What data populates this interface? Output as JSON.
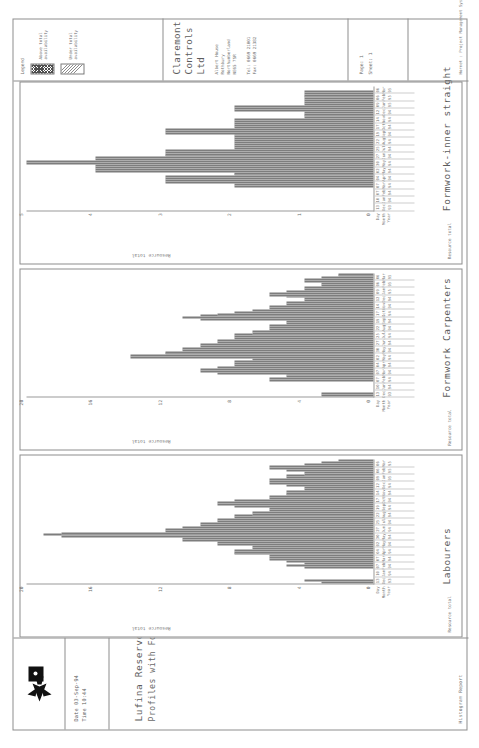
{
  "report": {
    "kind": "Histogram Report",
    "title_line1": "Lufina Reservoir Scheme",
    "title_line2": "Profiles with Formwork Limited",
    "date_label": "Date 03-Sep-94",
    "time_label": "Time 10:44",
    "logo_name": "claremont-bird-logo"
  },
  "company": {
    "name": "Claremont Controls Ltd",
    "address_line1": "Albert House",
    "address_line2": "Rothbury",
    "address_line3": "Northumberland",
    "address_line4": "NE65 7SR",
    "tel": "Tel: 0669 21001",
    "fax": "Fax: 0669 21382"
  },
  "legend": {
    "label": "Legend",
    "items": [
      {
        "name": "above-total-availability",
        "text": "Above total availability",
        "pattern": "cross-hatch"
      },
      {
        "name": "under-total-availability",
        "text": "Under total availability",
        "pattern": "diagonal-hatch"
      }
    ]
  },
  "footer": {
    "page_label": "Page: 1",
    "sheet_label": "Sheet: 1",
    "system": "Hornet : Project Management Systems"
  },
  "axis": {
    "header_day": "Day",
    "header_month": "Month",
    "header_year": "Year",
    "ticks": [
      {
        "d": "13",
        "m": "Dec",
        "y": "93"
      },
      {
        "d": "10",
        "m": "Jan",
        "y": "94"
      },
      {
        "d": "07",
        "m": "Feb",
        "y": "94"
      },
      {
        "d": "07",
        "m": "Mar",
        "y": "94"
      },
      {
        "d": "04",
        "m": "Apr",
        "y": "94"
      },
      {
        "d": "02",
        "m": "May",
        "y": "94"
      },
      {
        "d": "30",
        "m": "May",
        "y": "94"
      },
      {
        "d": "27",
        "m": "Jun",
        "y": "94"
      },
      {
        "d": "25",
        "m": "Jul",
        "y": "94"
      },
      {
        "d": "22",
        "m": "Aug",
        "y": "94"
      },
      {
        "d": "19",
        "m": "Sep",
        "y": "94"
      },
      {
        "d": "17",
        "m": "Oct",
        "y": "94"
      },
      {
        "d": "14",
        "m": "Nov",
        "y": "94"
      },
      {
        "d": "12",
        "m": "Dec",
        "y": "94"
      },
      {
        "d": "09",
        "m": "Jan",
        "y": "95"
      },
      {
        "d": "06",
        "m": "Feb",
        "y": "95"
      },
      {
        "d": "06",
        "m": "Mar",
        "y": "95"
      }
    ]
  },
  "chart_data": [
    {
      "type": "bar",
      "name": "labourers",
      "title": "Labourers",
      "ylabel": "Resource total",
      "xlabel": "",
      "ylim": [
        0,
        20
      ],
      "yticks": [
        0,
        4,
        8,
        12,
        16,
        20
      ],
      "grid": false,
      "categories": [
        "13-Dec-93",
        "20-Dec-93",
        "27-Dec-93",
        "03-Jan-94",
        "10-Jan-94",
        "17-Jan-94",
        "24-Jan-94",
        "31-Jan-94",
        "07-Feb-94",
        "14-Feb-94",
        "21-Feb-94",
        "28-Feb-94",
        "07-Mar-94",
        "14-Mar-94",
        "21-Mar-94",
        "28-Mar-94",
        "04-Apr-94",
        "11-Apr-94",
        "18-Apr-94",
        "25-Apr-94",
        "02-May-94",
        "09-May-94",
        "16-May-94",
        "23-May-94",
        "30-May-94",
        "06-Jun-94",
        "13-Jun-94",
        "20-Jun-94",
        "27-Jun-94",
        "04-Jul-94",
        "11-Jul-94",
        "18-Jul-94",
        "25-Jul-94",
        "01-Aug-94",
        "08-Aug-94",
        "15-Aug-94",
        "22-Aug-94",
        "29-Aug-94",
        "05-Sep-94",
        "12-Sep-94",
        "19-Sep-94",
        "26-Sep-94",
        "03-Oct-94",
        "10-Oct-94",
        "17-Oct-94",
        "24-Oct-94",
        "31-Oct-94",
        "07-Nov-94",
        "14-Nov-94",
        "21-Nov-94",
        "28-Nov-94",
        "05-Dec-94",
        "12-Dec-94",
        "19-Dec-94",
        "26-Dec-94",
        "02-Jan-95",
        "09-Jan-95",
        "16-Jan-95",
        "23-Jan-95",
        "30-Jan-95",
        "06-Feb-95",
        "13-Feb-95",
        "20-Feb-95",
        "27-Feb-95",
        "06-Mar-95"
      ],
      "values": [
        3,
        4,
        0,
        0,
        0,
        0,
        0,
        0,
        4,
        5,
        4,
        5,
        6,
        6,
        6,
        8,
        8,
        8,
        7,
        7,
        9,
        9,
        11,
        11,
        18,
        19,
        18,
        12,
        12,
        11,
        10,
        10,
        9,
        9,
        8,
        8,
        7,
        7,
        6,
        6,
        8,
        9,
        9,
        8,
        6,
        6,
        5,
        5,
        5,
        4,
        4,
        5,
        6,
        6,
        6,
        5,
        5,
        4,
        4,
        5,
        6,
        6,
        4,
        3,
        2
      ],
      "series_flags": "above when value exceeds total availability line"
    },
    {
      "type": "bar",
      "name": "formwork-carpenters",
      "title": "Formwork Carpenters",
      "ylabel": "Resource total",
      "xlabel": "",
      "ylim": [
        0,
        20
      ],
      "yticks": [
        0,
        4,
        8,
        12,
        16,
        20
      ],
      "grid": false,
      "categories": [
        "13-Dec-93",
        "20-Dec-93",
        "27-Dec-93",
        "03-Jan-94",
        "10-Jan-94",
        "17-Jan-94",
        "24-Jan-94",
        "31-Jan-94",
        "07-Feb-94",
        "14-Feb-94",
        "21-Feb-94",
        "28-Feb-94",
        "07-Mar-94",
        "14-Mar-94",
        "21-Mar-94",
        "28-Mar-94",
        "04-Apr-94",
        "11-Apr-94",
        "18-Apr-94",
        "25-Apr-94",
        "02-May-94",
        "09-May-94",
        "16-May-94",
        "23-May-94",
        "30-May-94",
        "06-Jun-94",
        "13-Jun-94",
        "20-Jun-94",
        "27-Jun-94",
        "04-Jul-94",
        "11-Jul-94",
        "18-Jul-94",
        "25-Jul-94",
        "01-Aug-94",
        "08-Aug-94",
        "15-Aug-94",
        "22-Aug-94",
        "29-Aug-94",
        "05-Sep-94",
        "12-Sep-94",
        "19-Sep-94",
        "26-Sep-94",
        "03-Oct-94",
        "10-Oct-94",
        "17-Oct-94",
        "24-Oct-94",
        "31-Oct-94",
        "07-Nov-94",
        "14-Nov-94",
        "21-Nov-94",
        "28-Nov-94",
        "05-Dec-94",
        "12-Dec-94",
        "19-Dec-94",
        "26-Dec-94",
        "02-Jan-95",
        "09-Jan-95",
        "16-Jan-95",
        "23-Jan-95",
        "30-Jan-95",
        "06-Feb-95",
        "13-Feb-95",
        "20-Feb-95",
        "27-Feb-95",
        "06-Mar-95"
      ],
      "values": [
        3,
        3,
        0,
        0,
        0,
        0,
        0,
        0,
        6,
        6,
        5,
        5,
        9,
        10,
        10,
        9,
        8,
        8,
        8,
        7,
        14,
        14,
        12,
        12,
        11,
        11,
        10,
        10,
        9,
        9,
        8,
        8,
        8,
        7,
        7,
        6,
        6,
        6,
        5,
        5,
        10,
        11,
        10,
        9,
        8,
        7,
        6,
        6,
        5,
        5,
        4,
        4,
        5,
        6,
        6,
        5,
        4,
        4,
        3,
        3,
        4,
        4,
        3,
        2,
        2
      ],
      "series_flags": "above when value exceeds total availability line"
    },
    {
      "type": "bar",
      "name": "formwork-inner-straight",
      "title": "Formwork-inner straight",
      "ylabel": "Resource total",
      "xlabel": "",
      "ylim": [
        0,
        5
      ],
      "yticks": [
        0,
        1,
        2,
        3,
        4,
        5
      ],
      "grid": false,
      "categories": [
        "13-Dec-93",
        "20-Dec-93",
        "27-Dec-93",
        "03-Jan-94",
        "10-Jan-94",
        "17-Jan-94",
        "24-Jan-94",
        "31-Jan-94",
        "07-Feb-94",
        "14-Feb-94",
        "21-Feb-94",
        "28-Feb-94",
        "07-Mar-94",
        "14-Mar-94",
        "21-Mar-94",
        "28-Mar-94",
        "04-Apr-94",
        "11-Apr-94",
        "18-Apr-94",
        "25-Apr-94",
        "02-May-94",
        "09-May-94",
        "16-May-94",
        "23-May-94",
        "30-May-94",
        "06-Jun-94",
        "13-Jun-94",
        "20-Jun-94",
        "27-Jun-94",
        "04-Jul-94",
        "11-Jul-94",
        "18-Jul-94",
        "25-Jul-94",
        "01-Aug-94",
        "08-Aug-94",
        "15-Aug-94",
        "22-Aug-94",
        "29-Aug-94",
        "05-Sep-94",
        "12-Sep-94",
        "19-Sep-94",
        "26-Sep-94",
        "03-Oct-94",
        "10-Oct-94",
        "17-Oct-94",
        "24-Oct-94",
        "31-Oct-94",
        "07-Nov-94",
        "14-Nov-94",
        "21-Nov-94",
        "28-Nov-94",
        "05-Dec-94",
        "12-Dec-94",
        "19-Dec-94",
        "26-Dec-94",
        "02-Jan-95",
        "09-Jan-95",
        "16-Jan-95",
        "23-Jan-95",
        "30-Jan-95",
        "06-Feb-95",
        "13-Feb-95",
        "20-Feb-95",
        "27-Feb-95",
        "06-Mar-95"
      ],
      "values": [
        0,
        0,
        0,
        0,
        0,
        0,
        0,
        0,
        0,
        0,
        0,
        0,
        2,
        2,
        3,
        3,
        3,
        3,
        2,
        2,
        4,
        4,
        4,
        4,
        5,
        5,
        4,
        4,
        3,
        3,
        3,
        3,
        2,
        2,
        2,
        2,
        2,
        2,
        2,
        2,
        3,
        3,
        3,
        2,
        2,
        2,
        2,
        2,
        1,
        1,
        1,
        1,
        2,
        2,
        2,
        1,
        1,
        1,
        1,
        1,
        1,
        1,
        1,
        0,
        0
      ],
      "series_flags": "above when value exceeds total availability line"
    }
  ]
}
